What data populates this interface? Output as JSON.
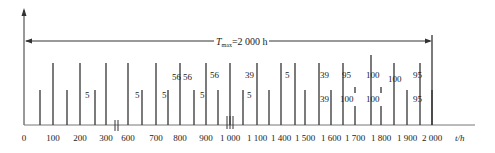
{
  "chart_data": {
    "type": "bar",
    "title": "",
    "annotation": {
      "label_main": "T",
      "label_sub": "max",
      "label_value": "=2 000 h"
    },
    "xlabel": "t/h",
    "ylabel": "",
    "x_ticks": [
      "0",
      "100",
      "200",
      "300",
      "600",
      "700",
      "800",
      "900",
      "1 000",
      "1 100",
      "1 400",
      "1 500",
      "1 600",
      "1 700",
      "1 800",
      "1 900",
      "2 000"
    ],
    "axis_breaks": [
      "300-600",
      "1000-1100"
    ],
    "bars": [
      {
        "x": 40,
        "h": "short"
      },
      {
        "x": 53,
        "h": "tall"
      },
      {
        "x": 67,
        "h": "short"
      },
      {
        "x": 80,
        "h": "tall"
      },
      {
        "x": 95,
        "h": "short",
        "label": "5",
        "label_x": 85
      },
      {
        "x": 106,
        "h": "tall"
      },
      {
        "x": 128,
        "h": "tall"
      },
      {
        "x": 142,
        "h": "short",
        "label": "5",
        "label_x": 135
      },
      {
        "x": 156,
        "h": "tall"
      },
      {
        "x": 168,
        "h": "short",
        "label": "5",
        "label_x": 162
      },
      {
        "x": 180,
        "h": "tall",
        "label": "56",
        "label_x": 172,
        "label_y": 80
      },
      {
        "x": 194,
        "h": "short"
      },
      {
        "x": 206,
        "h": "tall",
        "label": "56",
        "label_x": 183,
        "label_y": 80
      },
      {
        "x": 218,
        "h": "short",
        "label": "5",
        "label_x": 200
      },
      {
        "x": 230,
        "h": "tall",
        "label": "56",
        "label_x": 210,
        "label_y": 78
      },
      {
        "x": 243,
        "h": "short"
      },
      {
        "x": 257,
        "h": "tall",
        "label": "39",
        "label_x": 245,
        "label_y": 78
      },
      {
        "x": 269,
        "h": "short",
        "label": "5",
        "label_x": 247
      },
      {
        "x": 281,
        "h": "tall"
      },
      {
        "x": 295,
        "h": "tall",
        "label": "5",
        "label_x": 285,
        "label_y": 78
      },
      {
        "x": 305,
        "h": "short"
      },
      {
        "x": 319,
        "h": "tall"
      },
      {
        "x": 331,
        "h": "short",
        "label": "39",
        "label_x": 320,
        "label_y": 78
      },
      {
        "x": 343,
        "h": "tall"
      },
      {
        "x": 355,
        "h": "split",
        "label_top": "95",
        "label_bottom": "100"
      },
      {
        "x": 371,
        "h": "tallest"
      },
      {
        "x": 381,
        "h": "split",
        "label_top": "100",
        "label_bottom": "100"
      },
      {
        "x": 394,
        "h": "tall"
      },
      {
        "x": 407,
        "h": "short",
        "label": "100",
        "label_x": 388,
        "label_y": 82
      },
      {
        "x": 420,
        "h": "tall",
        "label": "95",
        "label_x": 413,
        "label_y": 78
      },
      {
        "x": 432,
        "h": "short",
        "label": "95",
        "label_x": 413,
        "label_y": 102
      },
      {
        "x": 432,
        "h": "end"
      }
    ],
    "extra_labels": [
      {
        "text": "39",
        "x": 320,
        "y": 102
      },
      {
        "text": "95",
        "x": 342,
        "y": 78
      },
      {
        "text": "100",
        "x": 340,
        "y": 102
      },
      {
        "text": "100",
        "x": 366,
        "y": 78
      },
      {
        "text": "100",
        "x": 366,
        "y": 102
      }
    ],
    "ylim": [
      "baseline",
      "top"
    ],
    "grid": false,
    "legend": "none"
  }
}
